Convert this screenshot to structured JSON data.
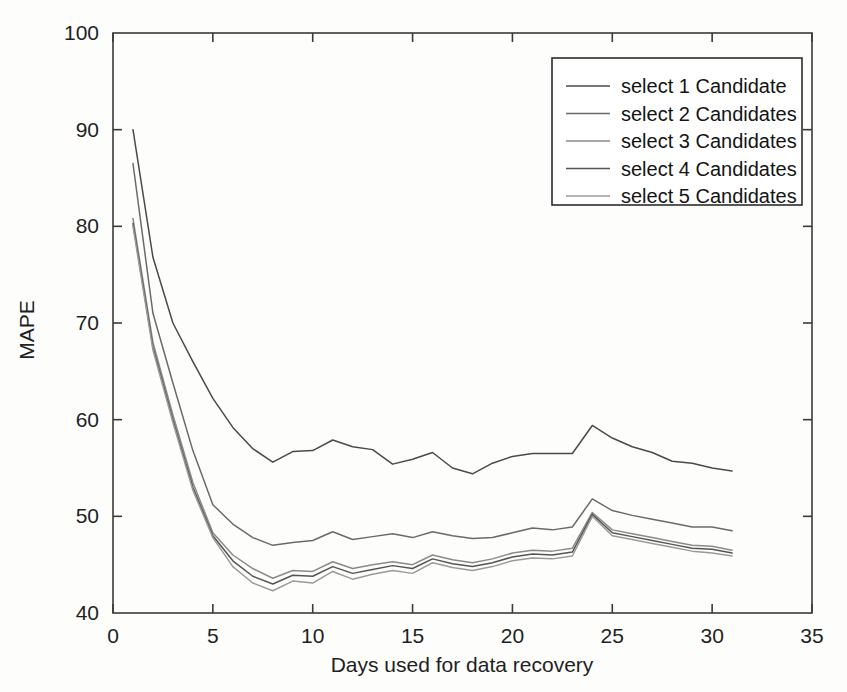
{
  "figure": {
    "background_color": "#fdfdfc",
    "axis_color": "#3a3a3a"
  },
  "chart_data": {
    "type": "line",
    "title": "",
    "xlabel": "Days used for data recovery",
    "ylabel": "MAPE",
    "xlim": [
      0,
      35
    ],
    "ylim": [
      40,
      100
    ],
    "xticks": [
      0,
      5,
      10,
      15,
      20,
      25,
      30,
      35
    ],
    "yticks": [
      40,
      50,
      60,
      70,
      80,
      90,
      100
    ],
    "xtick_labels": [
      "0",
      "5",
      "10",
      "15",
      "20",
      "25",
      "30",
      "35"
    ],
    "ytick_labels": [
      "40",
      "50",
      "60",
      "70",
      "80",
      "90",
      "100"
    ],
    "grid": false,
    "legend_position": "top-right",
    "x": [
      1,
      2,
      3,
      4,
      5,
      6,
      7,
      8,
      9,
      10,
      11,
      12,
      13,
      14,
      15,
      16,
      17,
      18,
      19,
      20,
      21,
      22,
      23,
      24,
      25,
      26,
      27,
      28,
      29,
      30,
      31
    ],
    "series": [
      {
        "name": "select 1 Candidate",
        "color": "#4a4a4a",
        "values": [
          90.0,
          76.8,
          70.0,
          66.0,
          62.2,
          59.2,
          57.0,
          55.6,
          56.7,
          56.8,
          57.9,
          57.2,
          56.9,
          55.4,
          55.9,
          56.6,
          55.0,
          54.4,
          55.5,
          56.2,
          56.5,
          56.5,
          56.5,
          59.4,
          58.1,
          57.2,
          56.6,
          55.7,
          55.5,
          55.0,
          54.7
        ]
      },
      {
        "name": "select 2 Candidates",
        "color": "#6a6a6a",
        "values": [
          86.5,
          71.0,
          63.8,
          56.8,
          51.2,
          49.2,
          47.8,
          47.0,
          47.3,
          47.5,
          48.4,
          47.6,
          47.9,
          48.2,
          47.8,
          48.4,
          48.0,
          47.7,
          47.8,
          48.3,
          48.8,
          48.6,
          48.9,
          51.8,
          50.6,
          50.1,
          49.7,
          49.3,
          48.9,
          48.9,
          48.5
        ]
      },
      {
        "name": "select 3 Candidates",
        "color": "#8a8a8a",
        "values": [
          80.8,
          68.0,
          60.5,
          53.5,
          48.3,
          46.0,
          44.6,
          43.6,
          44.4,
          44.3,
          45.3,
          44.6,
          45.0,
          45.3,
          45.0,
          46.0,
          45.5,
          45.2,
          45.6,
          46.2,
          46.5,
          46.4,
          46.7,
          50.4,
          48.6,
          48.2,
          47.8,
          47.4,
          47.0,
          46.9,
          46.5
        ]
      },
      {
        "name": "select 4 Candidates",
        "color": "#555555",
        "values": [
          80.3,
          67.5,
          60.0,
          53.0,
          48.0,
          45.4,
          43.8,
          43.0,
          43.9,
          43.8,
          44.8,
          44.1,
          44.5,
          44.9,
          44.6,
          45.6,
          45.1,
          44.8,
          45.2,
          45.8,
          46.1,
          46.0,
          46.3,
          50.2,
          48.3,
          47.9,
          47.5,
          47.1,
          46.7,
          46.6,
          46.2
        ]
      },
      {
        "name": "select 5 Candidates",
        "color": "#9a9a9a",
        "values": [
          80.0,
          67.2,
          59.7,
          52.7,
          47.8,
          44.8,
          43.1,
          42.3,
          43.3,
          43.1,
          44.3,
          43.5,
          44.0,
          44.4,
          44.1,
          45.2,
          44.7,
          44.4,
          44.8,
          45.4,
          45.7,
          45.6,
          45.9,
          50.0,
          48.0,
          47.6,
          47.2,
          46.8,
          46.4,
          46.2,
          45.9
        ]
      }
    ]
  },
  "legend": {
    "entries": [
      {
        "label": "select 1 Candidate"
      },
      {
        "label": "select 2 Candidates"
      },
      {
        "label": "select 3 Candidates"
      },
      {
        "label": "select 4 Candidates"
      },
      {
        "label": "select 5 Candidates"
      }
    ]
  }
}
